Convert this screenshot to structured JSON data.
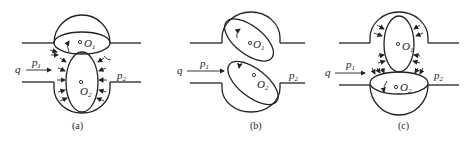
{
  "figure": {
    "panels": [
      {
        "id": "a",
        "caption": "(a)",
        "labels": {
          "flow": "q",
          "p1": "p",
          "p1_sub": "1",
          "p2": "p",
          "p2_sub": "2",
          "o1": "O",
          "o1_sub": "1",
          "o2": "O",
          "o2_sub": "2"
        }
      },
      {
        "id": "b",
        "caption": "(b)",
        "labels": {
          "flow": "q",
          "p1": "p",
          "p1_sub": "1",
          "p2": "p",
          "p2_sub": "2",
          "o1": "O",
          "o1_sub": "1",
          "o2": "O",
          "o2_sub": "2"
        }
      },
      {
        "id": "c",
        "caption": "(c)",
        "labels": {
          "flow": "q",
          "p1": "p",
          "p1_sub": "1",
          "p2": "p",
          "p2_sub": "2",
          "o1": "O",
          "o1_sub": "1",
          "o2": "O",
          "o2_sub": "2"
        }
      }
    ],
    "colors": {
      "stroke": "#222222",
      "background": "#ffffff"
    }
  }
}
